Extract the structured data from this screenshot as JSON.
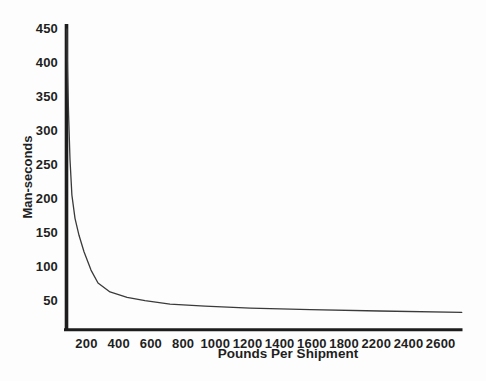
{
  "figure": {
    "background_color": "#fdfdfd",
    "axis_color": "#1d1d1d",
    "curve_color": "#3a3a3a",
    "text_color": "#1f1f1f"
  },
  "chart_data": {
    "type": "line",
    "title": "",
    "xlabel": "Pounds Per Shipment",
    "ylabel": "Man-seconds",
    "xlim": [
      0,
      2800
    ],
    "ylim": [
      0,
      460
    ],
    "grid": false,
    "legend": false,
    "x_tick_labels": [
      "200",
      "400",
      "600",
      "800",
      "1000",
      "1200",
      "1400",
      "1600",
      "1800",
      "2200",
      "2400",
      "2600"
    ],
    "y_ticks": [
      450,
      400,
      350,
      300,
      250,
      200,
      150,
      100,
      50
    ],
    "note": "x-axis labels skip 2000 in the source figure",
    "series": [
      {
        "name": "",
        "points": [
          [
            54,
            450
          ],
          [
            58,
            390
          ],
          [
            65,
            323
          ],
          [
            75,
            258
          ],
          [
            88,
            206
          ],
          [
            109,
            172
          ],
          [
            136,
            147
          ],
          [
            170,
            123
          ],
          [
            218,
            96
          ],
          [
            265,
            77
          ],
          [
            347,
            64
          ],
          [
            463,
            56
          ],
          [
            585,
            51
          ],
          [
            755,
            46
          ],
          [
            993,
            43
          ],
          [
            1300,
            40
          ],
          [
            1710,
            38
          ],
          [
            2180,
            36
          ],
          [
            2740,
            34
          ]
        ]
      }
    ]
  }
}
